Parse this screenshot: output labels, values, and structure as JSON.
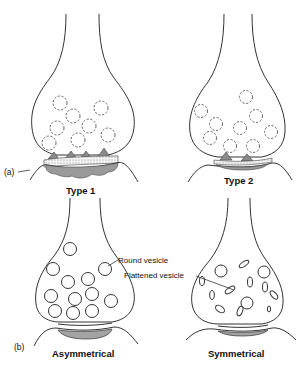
{
  "figure": {
    "part_a": {
      "marker": "(a)",
      "left_label": "Type 1",
      "right_label": "Type 2"
    },
    "part_b": {
      "marker": "(b)",
      "left_label": "Asymmetrical",
      "right_label": "Symmetrical"
    },
    "annotations": {
      "round_vesicle": "Round vesicle",
      "flattened_vesicle": "Flattened vesicle"
    },
    "colors": {
      "line": "#333333",
      "density_fill": "#8a8a8a",
      "background": "#ffffff"
    }
  }
}
